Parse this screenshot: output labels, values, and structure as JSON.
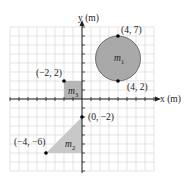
{
  "diagram": {
    "axes": {
      "x_label": "x (m)",
      "y_label": "y (m)",
      "grid_range": {
        "x": [
          -8,
          8
        ],
        "y": [
          -8,
          8
        ]
      },
      "grid_unit_m": 1
    },
    "points": [
      {
        "id": "p47",
        "label": "(4, 7)",
        "x": 4,
        "y": 7
      },
      {
        "id": "p42",
        "label": "(4, 2)",
        "x": 4,
        "y": 2
      },
      {
        "id": "pm22",
        "label": "(−2, 2)",
        "x": -2,
        "y": 2
      },
      {
        "id": "p0m2",
        "label": "(0, −2)",
        "x": 0,
        "y": -2
      },
      {
        "id": "pm4m6",
        "label": "(−4, −6)",
        "x": -4,
        "y": -6
      }
    ],
    "masses": [
      {
        "id": "m1",
        "name": "m",
        "sub": "1",
        "shape": "circle",
        "center": [
          4,
          4.5
        ],
        "radius": 2.5
      },
      {
        "id": "m2",
        "name": "m",
        "sub": "2",
        "shape": "triangle",
        "vertices": [
          [
            -4,
            -6
          ],
          [
            0,
            -6
          ],
          [
            0,
            -2
          ]
        ]
      },
      {
        "id": "m3",
        "name": "m",
        "sub": "3",
        "shape": "square",
        "corners": [
          [
            -2,
            0
          ],
          [
            0,
            2
          ]
        ]
      }
    ],
    "colors": {
      "grid": "#d9d9d9",
      "axis": "#222222",
      "circle_fill": "#a9a9a9",
      "triangle_fill": "#c8c8c8",
      "square_fill": "#b5b5b5"
    }
  }
}
